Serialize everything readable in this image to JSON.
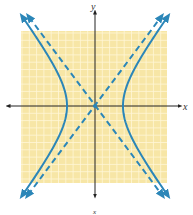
{
  "chart_data": {
    "type": "line",
    "title": "",
    "xlabel": "x",
    "ylabel": "y",
    "grid": true,
    "background_color": "#f7e6a6",
    "grid_color": "#fff6d8",
    "curve_color": "#2b86b8",
    "asymptote_color": "#2b86b8",
    "axis_color": "#222222",
    "xlim": [
      -10,
      10
    ],
    "ylim": [
      -10,
      10
    ],
    "series": [
      {
        "name": "hyperbola",
        "equation": "x^2/16 - y^2/28.4 = 1",
        "style": "solid",
        "vertices": [
          [
            -4,
            0
          ],
          [
            4,
            0
          ]
        ]
      },
      {
        "name": "asymptote_1",
        "equation": "y = 1.33x",
        "style": "dashed"
      },
      {
        "name": "asymptote_2",
        "equation": "y = -1.33x",
        "style": "dashed"
      }
    ],
    "annotations": {
      "bottom_label": "x"
    }
  }
}
